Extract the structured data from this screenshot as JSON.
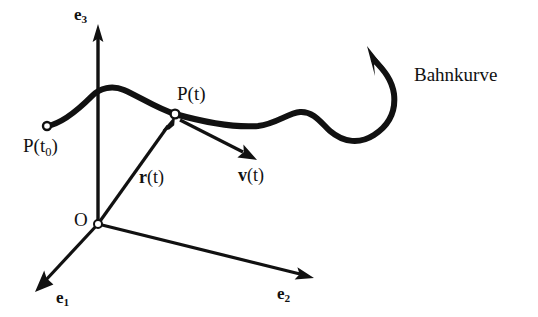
{
  "figure": {
    "background_color": "#ffffff",
    "ink_color": "#111111"
  },
  "axes": [
    {
      "id": "e3",
      "name": "e3-axis",
      "label_base": "e",
      "label_sub": "3",
      "direction": "up",
      "from": [
        98,
        224
      ],
      "to": [
        98,
        26
      ]
    },
    {
      "id": "e1",
      "name": "e1-axis",
      "label_base": "e",
      "label_sub": "1",
      "direction": "down-left",
      "from": [
        98,
        224
      ],
      "to": [
        36,
        291
      ]
    },
    {
      "id": "e2",
      "name": "e2-axis",
      "label_base": "e",
      "label_sub": "2",
      "direction": "down-right",
      "from": [
        98,
        224
      ],
      "to": [
        313,
        278
      ]
    }
  ],
  "points": [
    {
      "id": "origin",
      "name": "origin-point",
      "label": "O",
      "marker": "open-circle",
      "at": [
        98,
        224
      ]
    },
    {
      "id": "p_t0",
      "name": "start-point",
      "label_base": "P(t",
      "label_sub": "0",
      "label_tail": ")",
      "marker": "open-circle",
      "at": [
        47,
        126
      ]
    },
    {
      "id": "p_t",
      "name": "current-point",
      "label": "P(t)",
      "marker": "open-circle",
      "at": [
        175,
        114
      ]
    }
  ],
  "vectors": [
    {
      "id": "r_t",
      "name": "position-vector",
      "label_bold": "r",
      "label_rest": "(t)",
      "from": [
        98,
        224
      ],
      "to": [
        174,
        117
      ]
    },
    {
      "id": "v_t",
      "name": "velocity-vector",
      "label_bold": "v",
      "label_rest": "(t)",
      "from": [
        178,
        118
      ],
      "to": [
        256,
        159
      ]
    }
  ],
  "curve": {
    "id": "bahnkurve",
    "name": "trajectory-curve",
    "label": "Bahnkurve",
    "stroke_width_px": 6,
    "arrowhead_at": [
      368,
      47
    ],
    "arrowhead_direction": "up-left"
  }
}
